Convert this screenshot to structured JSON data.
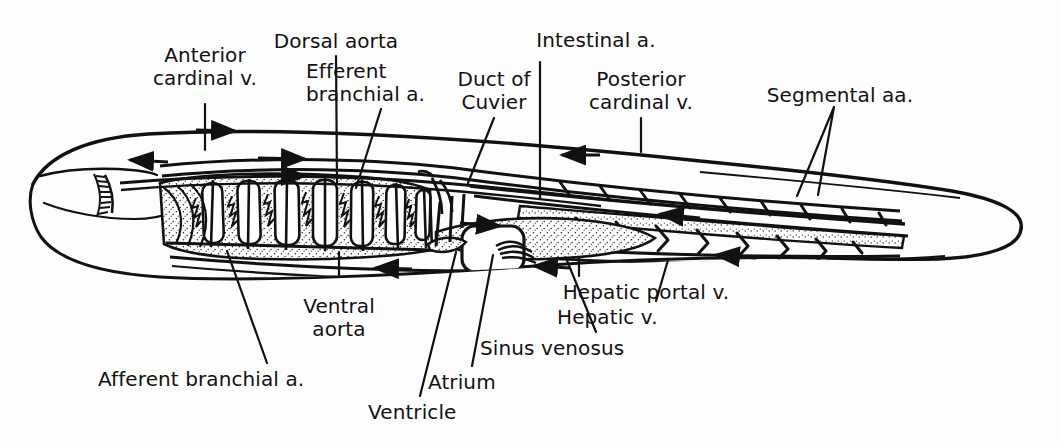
{
  "figure": {
    "background_color": "#fdfdfd",
    "ink_color": "#111111"
  },
  "labels": [
    {
      "id": "anterior-cardinal-v",
      "line1": "Anterior",
      "line2": "cardinal v.",
      "x": 205,
      "y": 52,
      "align": "c"
    },
    {
      "id": "dorsal-aorta",
      "line1": "Dorsal aorta",
      "line2": "",
      "x": 336,
      "y": 33,
      "align": "c"
    },
    {
      "id": "efferent-branchial-a",
      "line1": "Efferent",
      "line2": "branchial a.",
      "x": 310,
      "y": 63,
      "align": "l"
    },
    {
      "id": "duct-of-cuvier",
      "line1": "Duct of",
      "line2": "Cuvier",
      "x": 494,
      "y": 72,
      "align": "c"
    },
    {
      "id": "intestinal-a",
      "line1": "Intestinal a.",
      "line2": "",
      "x": 596,
      "y": 32,
      "align": "c"
    },
    {
      "id": "posterior-cardinal-v",
      "line1": "Posterior",
      "line2": "cardinal v.",
      "x": 641,
      "y": 72,
      "align": "c"
    },
    {
      "id": "segmental-aa",
      "line1": "Segmental aa.",
      "line2": "",
      "x": 835,
      "y": 88,
      "align": "c"
    },
    {
      "id": "hepatic-portal-v",
      "line1": "Hepatic portal v.",
      "line2": "",
      "x": 646,
      "y": 285,
      "align": "c"
    },
    {
      "id": "hepatic-v",
      "line1": "Hepatic v.",
      "line2": "",
      "x": 561,
      "y": 310,
      "align": "l"
    },
    {
      "id": "sinus-venosus",
      "line1": "Sinus venosus",
      "line2": "",
      "x": 483,
      "y": 341,
      "align": "l"
    },
    {
      "id": "ventral-aorta",
      "line1": "Ventral",
      "line2": "aorta",
      "x": 339,
      "y": 299,
      "align": "c"
    },
    {
      "id": "atrium",
      "line1": "Atrium",
      "line2": "",
      "x": 431,
      "y": 375,
      "align": "l"
    },
    {
      "id": "ventricle",
      "line1": "Ventricle",
      "line2": "",
      "x": 370,
      "y": 405,
      "align": "l"
    },
    {
      "id": "afferent-branchial-a",
      "line1": "Afferent branchial a.",
      "line2": "",
      "x": 99,
      "y": 372,
      "align": "l"
    }
  ],
  "structures": [
    {
      "id": "body-outline",
      "name": "shark body outline"
    },
    {
      "id": "head",
      "name": "head with gill slits"
    },
    {
      "id": "gill-arches",
      "name": "gill arches / branchial pouches",
      "count": 7
    },
    {
      "id": "dorsal-aorta-vessel",
      "name": "dorsal aorta"
    },
    {
      "id": "ventral-aorta-vessel",
      "name": "ventral aorta"
    },
    {
      "id": "heart",
      "name": "heart — ventricle, atrium, sinus venosus"
    },
    {
      "id": "liver",
      "name": "liver mass"
    },
    {
      "id": "intestine",
      "name": "intestine / gut tube"
    },
    {
      "id": "segmental-arteries",
      "name": "segmental arteries",
      "count": 9
    },
    {
      "id": "posterior-cardinal",
      "name": "posterior cardinal vein"
    },
    {
      "id": "flow-arrows",
      "name": "blood-flow direction arrows",
      "count": 10
    }
  ]
}
